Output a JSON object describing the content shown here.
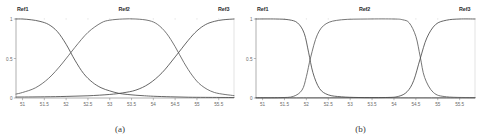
{
  "figure": {
    "panels": [
      {
        "id": "panel-a",
        "caption": "(a)",
        "set_labels": [
          "Ref1",
          "Ref2",
          "Ref3"
        ],
        "chart_data": {
          "type": "line",
          "title": "",
          "xlabel": "",
          "ylabel": "",
          "xlim": [
            50.85,
            55.85
          ],
          "ylim": [
            0,
            1
          ],
          "grid": false,
          "legend": "inline-top",
          "xticks": [
            "51",
            "51.5",
            "52",
            "52.5",
            "53",
            "53.5",
            "54",
            "54.5",
            "55",
            "55.5"
          ],
          "xtick_values": [
            51,
            51.5,
            52,
            52.5,
            53,
            53.5,
            54,
            54.5,
            55,
            55.5
          ],
          "yticks": [
            "0",
            "0.5",
            "1"
          ],
          "ytick_values": [
            0,
            0.5,
            1
          ],
          "series": [
            {
              "name": "Ref1",
              "color": "#4a4a4a",
              "x": [
                50.85,
                51.0,
                51.2,
                51.4,
                51.6,
                51.8,
                52.0,
                52.2,
                52.4,
                52.6,
                52.8,
                53.0,
                53.2,
                53.4,
                53.6,
                53.8,
                54.0,
                54.4,
                54.8,
                55.2,
                55.85
              ],
              "values": [
                1.0,
                1.0,
                0.99,
                0.97,
                0.93,
                0.84,
                0.68,
                0.48,
                0.31,
                0.2,
                0.13,
                0.09,
                0.06,
                0.045,
                0.035,
                0.028,
                0.022,
                0.015,
                0.01,
                0.008,
                0.006
              ]
            },
            {
              "name": "Ref2",
              "color": "#5d5d5d",
              "x": [
                50.85,
                51.0,
                51.3,
                51.6,
                51.9,
                52.2,
                52.5,
                52.8,
                53.0,
                53.3,
                53.6,
                53.9,
                54.1,
                54.3,
                54.5,
                54.7,
                54.9,
                55.1,
                55.4,
                55.85
              ],
              "values": [
                0.05,
                0.07,
                0.13,
                0.25,
                0.43,
                0.64,
                0.83,
                0.95,
                0.985,
                1.0,
                1.0,
                0.98,
                0.93,
                0.82,
                0.65,
                0.45,
                0.28,
                0.16,
                0.07,
                0.03
              ]
            },
            {
              "name": "Ref3",
              "color": "#4a4a4a",
              "x": [
                50.85,
                51.5,
                52.0,
                52.5,
                53.0,
                53.3,
                53.6,
                53.9,
                54.2,
                54.5,
                54.8,
                55.0,
                55.2,
                55.4,
                55.6,
                55.85
              ],
              "values": [
                0.012,
                0.015,
                0.02,
                0.028,
                0.045,
                0.065,
                0.1,
                0.18,
                0.32,
                0.52,
                0.73,
                0.85,
                0.93,
                0.97,
                0.99,
                1.0
              ]
            }
          ]
        }
      },
      {
        "id": "panel-b",
        "caption": "(b)",
        "set_labels": [
          "Ref1",
          "Ref2",
          "Ref3"
        ],
        "chart_data": {
          "type": "line",
          "title": "",
          "xlabel": "",
          "ylabel": "",
          "xlim": [
            50.85,
            55.85
          ],
          "ylim": [
            0,
            1
          ],
          "grid": false,
          "legend": "inline-top",
          "xticks": [
            "51",
            "51.5",
            "52",
            "52.5",
            "53",
            "53.5",
            "54",
            "54.5",
            "55",
            "55.5"
          ],
          "xtick_values": [
            51,
            51.5,
            52,
            52.5,
            53,
            53.5,
            54,
            54.5,
            55,
            55.5
          ],
          "yticks": [
            "0",
            "0.5",
            "1"
          ],
          "ytick_values": [
            0,
            0.5,
            1
          ],
          "series": [
            {
              "name": "Ref1",
              "color": "#4a4a4a",
              "x": [
                50.85,
                51.3,
                51.6,
                51.8,
                51.95,
                52.05,
                52.15,
                52.3,
                52.5,
                52.8,
                53.2,
                53.8,
                54.5,
                55.2,
                55.85
              ],
              "values": [
                1.0,
                1.0,
                0.99,
                0.95,
                0.82,
                0.58,
                0.32,
                0.12,
                0.04,
                0.015,
                0.006,
                0.003,
                0.002,
                0.002,
                0.002
              ]
            },
            {
              "name": "Ref2",
              "color": "#5d5d5d",
              "x": [
                50.85,
                51.4,
                51.7,
                51.9,
                52.0,
                52.1,
                52.25,
                52.45,
                52.8,
                53.4,
                54.0,
                54.2,
                54.35,
                54.5,
                54.6,
                54.7,
                54.9,
                55.2,
                55.85
              ],
              "values": [
                0.003,
                0.005,
                0.02,
                0.1,
                0.27,
                0.52,
                0.8,
                0.94,
                0.99,
                1.0,
                1.0,
                0.99,
                0.95,
                0.78,
                0.52,
                0.26,
                0.07,
                0.015,
                0.005
              ]
            },
            {
              "name": "Ref3",
              "color": "#4a4a4a",
              "x": [
                50.85,
                52.0,
                53.0,
                53.8,
                54.1,
                54.3,
                54.45,
                54.6,
                54.75,
                54.95,
                55.2,
                55.5,
                55.85
              ],
              "values": [
                0.002,
                0.002,
                0.003,
                0.006,
                0.02,
                0.08,
                0.22,
                0.5,
                0.76,
                0.93,
                0.985,
                1.0,
                1.0
              ]
            }
          ]
        }
      }
    ]
  }
}
